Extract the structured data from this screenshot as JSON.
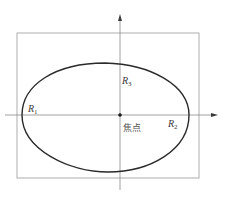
{
  "diagram": {
    "type": "polar-boundary-curve",
    "colors": {
      "background": "#ffffff",
      "curve": "#2a2a2a",
      "axis": "#8a8a8a",
      "frame": "#9a9a9a",
      "text": "#3a3a3a"
    },
    "labels": {
      "r1": {
        "main": "R",
        "sub": "1"
      },
      "r2": {
        "main": "R",
        "sub": "2"
      },
      "r3": {
        "main": "R",
        "sub": "3"
      },
      "focus": "焦点"
    },
    "geometry": {
      "frame": {
        "x": 17,
        "y": 33,
        "width": 182,
        "height": 145
      },
      "origin": {
        "x": 120,
        "y": 115
      },
      "x_axis": {
        "from": 5,
        "to": 218
      },
      "y_axis": {
        "from": 15,
        "to": 190
      },
      "curve_extents": {
        "left": 22,
        "right": 189,
        "top": 63,
        "bottom": 172
      }
    }
  }
}
